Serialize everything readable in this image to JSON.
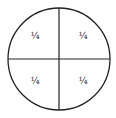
{
  "diagram": {
    "stroke_color": "#222222",
    "background": "#ffffff",
    "quadrants": [
      {
        "position": "top-left",
        "label": "¼"
      },
      {
        "position": "top-right",
        "label": "¼"
      },
      {
        "position": "bottom-left",
        "label": "¼"
      },
      {
        "position": "bottom-right",
        "label": "¼"
      }
    ]
  }
}
